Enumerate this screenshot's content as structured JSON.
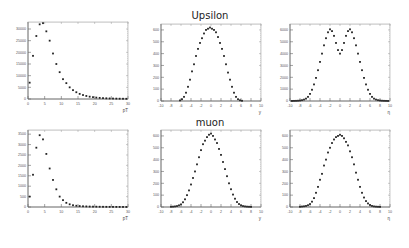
{
  "rows": [
    {
      "title": "Upsilon"
    },
    {
      "title": "muon"
    }
  ],
  "chart_data": [
    {
      "id": "upsilon-pt",
      "type": "scatter",
      "title": "",
      "row": "Upsilon",
      "xlabel": "pT",
      "ylabel": "",
      "xlim": [
        0,
        30
      ],
      "ylim": [
        0,
        33000
      ],
      "xticks": [
        0,
        5,
        10,
        15,
        20,
        25,
        30
      ],
      "xticklabels": [
        "0",
        "5",
        "10",
        "15",
        "20",
        "25",
        "30"
      ],
      "yticks": [
        0,
        5000,
        10000,
        15000,
        20000,
        25000,
        30000
      ],
      "yticklabels": [
        "0",
        "5000",
        "10000",
        "15000",
        "20000",
        "25000",
        "30000"
      ],
      "x": [
        0.5,
        1.5,
        2.5,
        3.5,
        4.5,
        5.5,
        6.5,
        7.5,
        8.5,
        9.5,
        10.5,
        11.5,
        12.5,
        13.5,
        14.5,
        15.5,
        16.5,
        17.5,
        18.5,
        19.5,
        20.5,
        21.5,
        22.5,
        23.5,
        24.5,
        25.5,
        26.5,
        27.5,
        28.5,
        29.5
      ],
      "y": [
        7000,
        18500,
        27000,
        32000,
        32500,
        29000,
        25000,
        19500,
        15000,
        11500,
        8500,
        6800,
        5000,
        3800,
        2900,
        2200,
        1700,
        1300,
        1000,
        800,
        600,
        480,
        380,
        300,
        240,
        200,
        160,
        130,
        110,
        90
      ]
    },
    {
      "id": "upsilon-y",
      "type": "scatter",
      "title": "",
      "row": "Upsilon",
      "xlabel": "y",
      "ylabel": "",
      "xlim": [
        -10,
        10
      ],
      "ylim": [
        0,
        650
      ],
      "xticks": [
        -10,
        -8,
        -6,
        -4,
        -2,
        0,
        2,
        4,
        6,
        8,
        10
      ],
      "xticklabels": [
        "-10",
        "-8",
        "-6",
        "-4",
        "-2",
        "0",
        "2",
        "4",
        "6",
        "8",
        "10"
      ],
      "yticks": [
        0,
        100,
        200,
        300,
        400,
        500,
        600
      ],
      "yticklabels": [
        "0",
        "100",
        "200",
        "300",
        "400",
        "500",
        "600"
      ],
      "x": [
        -6.2,
        -5.8,
        -5.4,
        -5.0,
        -4.6,
        -4.2,
        -3.8,
        -3.4,
        -3.0,
        -2.6,
        -2.2,
        -1.8,
        -1.4,
        -1.0,
        -0.6,
        -0.2,
        0.2,
        0.6,
        1.0,
        1.4,
        1.8,
        2.2,
        2.6,
        3.0,
        3.4,
        3.8,
        4.2,
        4.6,
        5.0,
        5.4,
        5.8,
        6.2
      ],
      "y": [
        5,
        15,
        35,
        70,
        120,
        180,
        250,
        310,
        380,
        440,
        490,
        530,
        570,
        600,
        610,
        620,
        610,
        600,
        580,
        540,
        490,
        440,
        380,
        310,
        240,
        180,
        120,
        70,
        35,
        15,
        6,
        2
      ]
    },
    {
      "id": "upsilon-eta",
      "type": "scatter",
      "title": "",
      "row": "Upsilon",
      "xlabel": "η",
      "ylabel": "",
      "xlim": [
        -10,
        10
      ],
      "ylim": [
        0,
        6500
      ],
      "xticks": [
        -10,
        -8,
        -6,
        -4,
        -2,
        0,
        2,
        4,
        6,
        8,
        10
      ],
      "xticklabels": [
        "-10",
        "-8",
        "-6",
        "-4",
        "-2",
        "0",
        "2",
        "4",
        "6",
        "8",
        "10"
      ],
      "yticks": [
        0,
        1000,
        2000,
        3000,
        4000,
        5000,
        6000
      ],
      "yticklabels": [
        "0",
        "1000",
        "2000",
        "3000",
        "4000",
        "5000",
        "6000"
      ],
      "x": [
        -9.6,
        -9.2,
        -8.8,
        -8.4,
        -8.0,
        -7.6,
        -7.2,
        -6.8,
        -6.4,
        -6.0,
        -5.6,
        -5.2,
        -4.8,
        -4.4,
        -4.0,
        -3.6,
        -3.2,
        -2.8,
        -2.4,
        -2.0,
        -1.6,
        -1.2,
        -0.8,
        -0.4,
        0.0,
        0.4,
        0.8,
        1.2,
        1.6,
        2.0,
        2.4,
        2.8,
        3.2,
        3.6,
        4.0,
        4.4,
        4.8,
        5.2,
        5.6,
        6.0,
        6.4,
        6.8,
        7.2,
        7.6,
        8.0,
        8.4,
        8.8,
        9.2,
        9.6
      ],
      "y": [
        5,
        10,
        15,
        25,
        40,
        70,
        120,
        200,
        350,
        600,
        950,
        1400,
        1950,
        2600,
        3300,
        4000,
        4700,
        5300,
        5800,
        6050,
        5900,
        5500,
        4900,
        4300,
        4000,
        4300,
        4900,
        5500,
        5900,
        6050,
        5800,
        5300,
        4700,
        4000,
        3300,
        2600,
        1950,
        1400,
        950,
        600,
        350,
        200,
        120,
        70,
        40,
        25,
        15,
        10,
        5
      ]
    },
    {
      "id": "muon-pt",
      "type": "scatter",
      "title": "",
      "row": "muon",
      "xlabel": "pT",
      "ylabel": "",
      "xlim": [
        0,
        30
      ],
      "ylim": [
        0,
        3700
      ],
      "xticks": [
        0,
        5,
        10,
        15,
        20,
        25,
        30
      ],
      "xticklabels": [
        "0",
        "5",
        "10",
        "15",
        "20",
        "25",
        "30"
      ],
      "yticks": [
        0,
        500,
        1000,
        1500,
        2000,
        2500,
        3000,
        3500
      ],
      "yticklabels": [
        "0",
        "500",
        "1000",
        "1500",
        "2000",
        "2500",
        "3000",
        "3500"
      ],
      "x": [
        0.5,
        1.5,
        2.5,
        3.5,
        4.5,
        5.5,
        6.5,
        7.5,
        8.5,
        9.5,
        10.5,
        11.5,
        12.5,
        13.5,
        14.5,
        15.5,
        16.5,
        17.5,
        18.5,
        19.5,
        20.5,
        21.5,
        22.5,
        23.5,
        24.5,
        25.5,
        26.5,
        27.5,
        28.5,
        29.5
      ],
      "y": [
        500,
        1550,
        2850,
        3450,
        3250,
        2550,
        1850,
        1300,
        850,
        500,
        330,
        200,
        130,
        85,
        60,
        45,
        35,
        28,
        22,
        18,
        15,
        12,
        10,
        8,
        7,
        6,
        5,
        4,
        3,
        2
      ]
    },
    {
      "id": "muon-y",
      "type": "scatter",
      "title": "",
      "row": "muon",
      "xlabel": "y",
      "ylabel": "",
      "xlim": [
        -10,
        10
      ],
      "ylim": [
        0,
        650
      ],
      "xticks": [
        -10,
        -8,
        -6,
        -4,
        -2,
        0,
        2,
        4,
        6,
        8,
        10
      ],
      "xticklabels": [
        "-10",
        "-8",
        "-6",
        "-4",
        "-2",
        "0",
        "2",
        "4",
        "6",
        "8",
        "10"
      ],
      "yticks": [
        0,
        100,
        200,
        300,
        400,
        500,
        600
      ],
      "yticklabels": [
        "0",
        "100",
        "200",
        "300",
        "400",
        "500",
        "600"
      ],
      "x": [
        -8.0,
        -7.6,
        -7.2,
        -6.8,
        -6.4,
        -6.0,
        -5.6,
        -5.2,
        -4.8,
        -4.4,
        -4.0,
        -3.6,
        -3.2,
        -2.8,
        -2.4,
        -2.0,
        -1.6,
        -1.2,
        -0.8,
        -0.4,
        0.0,
        0.4,
        0.8,
        1.2,
        1.6,
        2.0,
        2.4,
        2.8,
        3.2,
        3.6,
        4.0,
        4.4,
        4.8,
        5.2,
        5.6,
        6.0,
        6.4,
        6.8,
        7.2,
        7.6,
        8.0
      ],
      "y": [
        2,
        3,
        5,
        8,
        14,
        22,
        40,
        65,
        100,
        140,
        190,
        245,
        300,
        360,
        420,
        480,
        530,
        560,
        590,
        610,
        620,
        600,
        570,
        540,
        490,
        440,
        380,
        320,
        260,
        200,
        150,
        105,
        70,
        42,
        25,
        14,
        8,
        5,
        3,
        2,
        1
      ]
    },
    {
      "id": "muon-eta",
      "type": "scatter",
      "title": "",
      "row": "muon",
      "xlabel": "η",
      "ylabel": "",
      "xlim": [
        -10,
        10
      ],
      "ylim": [
        0,
        650
      ],
      "xticks": [
        -10,
        -8,
        -6,
        -4,
        -2,
        0,
        2,
        4,
        6,
        8,
        10
      ],
      "xticklabels": [
        "-10",
        "-8",
        "-6",
        "-4",
        "-2",
        "0",
        "2",
        "4",
        "6",
        "8",
        "10"
      ],
      "yticks": [
        0,
        100,
        200,
        300,
        400,
        500,
        600
      ],
      "yticklabels": [
        "0",
        "100",
        "200",
        "300",
        "400",
        "500",
        "600"
      ],
      "x": [
        -8.0,
        -7.6,
        -7.2,
        -6.8,
        -6.4,
        -6.0,
        -5.6,
        -5.2,
        -4.8,
        -4.4,
        -4.0,
        -3.6,
        -3.2,
        -2.8,
        -2.4,
        -2.0,
        -1.6,
        -1.2,
        -0.8,
        -0.4,
        0.0,
        0.4,
        0.8,
        1.2,
        1.6,
        2.0,
        2.4,
        2.8,
        3.2,
        3.6,
        4.0,
        4.4,
        4.8,
        5.2,
        5.6,
        6.0,
        6.4,
        6.8,
        7.2,
        7.6,
        8.0
      ],
      "y": [
        2,
        4,
        6,
        9,
        15,
        25,
        45,
        75,
        120,
        170,
        230,
        280,
        350,
        400,
        460,
        500,
        540,
        570,
        590,
        600,
        610,
        600,
        580,
        550,
        520,
        470,
        420,
        360,
        290,
        230,
        170,
        120,
        80,
        50,
        30,
        17,
        9,
        5,
        3,
        2,
        1
      ]
    }
  ]
}
